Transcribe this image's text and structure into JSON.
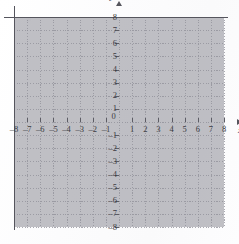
{
  "figure": {
    "kind": "cartesian-coordinate-grid",
    "origin_label": "0",
    "axis_names": {
      "x": "x",
      "y": "y"
    },
    "arrowheads": {
      "x_positive": true,
      "y_positive": true
    },
    "grid_style": "dotted",
    "grid_color": "#8f8f98",
    "axis_color": "#55555d",
    "background_color": "#fdfdfd",
    "label_color": "#3b3b41"
  },
  "chart_data": {
    "type": "scatter",
    "title": "",
    "subtitle": "",
    "xlabel": "x",
    "ylabel": "y",
    "xlim": [
      -8,
      8
    ],
    "ylim": [
      -8,
      8
    ],
    "xticks": [
      -8,
      -7,
      -6,
      -5,
      -4,
      -3,
      -2,
      -1,
      0,
      1,
      2,
      3,
      4,
      5,
      6,
      7,
      8
    ],
    "yticks": [
      -8,
      -7,
      -6,
      -5,
      -4,
      -3,
      -2,
      -1,
      0,
      1,
      2,
      3,
      4,
      5,
      6,
      7,
      8
    ],
    "xtick_labels": [
      "–8",
      "–7",
      "–6",
      "–5",
      "–4",
      "–3",
      "–2",
      "–1",
      "0",
      "1",
      "2",
      "3",
      "4",
      "5",
      "6",
      "7",
      "8"
    ],
    "ytick_labels": [
      "–8",
      "–7",
      "–6",
      "–5",
      "–4",
      "–3",
      "–2",
      "–1",
      "0",
      "1",
      "2",
      "3",
      "4",
      "5",
      "6",
      "7",
      "8"
    ],
    "grid": true,
    "legend": false,
    "legend_position": "none",
    "annotations": [],
    "series": [
      {
        "name": "",
        "x": [],
        "y": []
      }
    ]
  },
  "axis_labels": {
    "x_negative": [
      "–8",
      "–7",
      "–6",
      "–5",
      "–4",
      "–3",
      "–2",
      "–1"
    ],
    "x_positive": [
      "1",
      "2",
      "3",
      "4",
      "5",
      "6",
      "7",
      "8"
    ],
    "y_positive": [
      "8",
      "7",
      "6",
      "5",
      "4",
      "3",
      "2",
      "1"
    ],
    "y_negative": [
      "–1",
      "–2",
      "–3",
      "–4",
      "–5",
      "–6",
      "–7",
      "–8"
    ]
  }
}
